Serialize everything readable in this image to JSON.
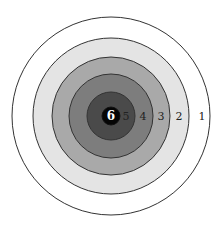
{
  "diagram": {
    "type": "concentric-target",
    "center": {
      "x": 111,
      "y": 116
    },
    "rings": [
      {
        "score": "1",
        "radius": 99,
        "fill": "#ffffff",
        "label_x": 202
      },
      {
        "score": "2",
        "radius": 78,
        "fill": "#e4e4e4",
        "label_x": 179
      },
      {
        "score": "3",
        "radius": 59,
        "fill": "#a9a9a9",
        "label_x": 161
      },
      {
        "score": "4",
        "radius": 42,
        "fill": "#7d7d7d",
        "label_x": 143
      },
      {
        "score": "5",
        "radius": 24,
        "fill": "#4a4a4a",
        "label_x": 126
      },
      {
        "score": "6",
        "radius": 9,
        "fill": "#050505",
        "label_x": 111
      }
    ],
    "stroke": "#333333"
  }
}
